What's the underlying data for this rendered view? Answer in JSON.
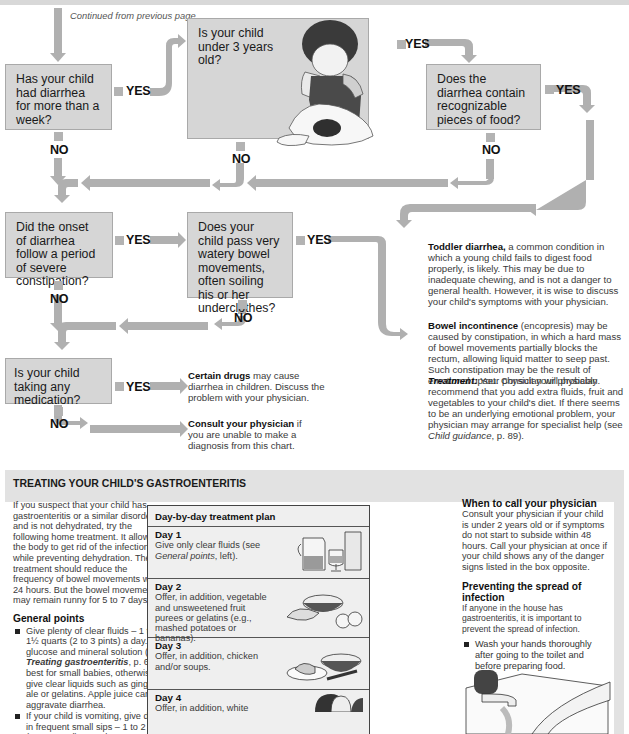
{
  "continued_note": "Continued from previous page",
  "flowchart": {
    "questions": [
      {
        "id": "q1",
        "text": "Has your child had diarrhea for more than a week?"
      },
      {
        "id": "q2",
        "text": "Is your child under 3 years old?"
      },
      {
        "id": "q3",
        "text": "Does the diarrhea contain recognizable pieces of food?"
      },
      {
        "id": "q4",
        "text": "Did the onset of diarrhea follow a period of severe constipation?"
      },
      {
        "id": "q5",
        "text": "Does your child pass very watery bowel movements, often soiling his or her underclothes?"
      },
      {
        "id": "q6",
        "text": "Is your child taking any medication?"
      }
    ],
    "yes_label": "YES",
    "no_label": "NO",
    "results": {
      "toddler": {
        "bold": "Toddler diarrhea,",
        "text": " a common condition in which a young child fails to digest food properly, is likely. This may be due to inadequate chewing, and is not a danger to general health. However, it is wise to discuss your child's symptoms with your physician."
      },
      "bowel": {
        "bold": "Bowel incontinence",
        "text": " (encopresis) may be caused by constipation, in which a hard mass of bowel movements partially blocks the rectum, allowing liquid matter to seep past. Such constipation may be the result of emotional upset. Consult your physician."
      },
      "treatment": {
        "bold": "Treatment:",
        "text": " Your physician will probably recommend that you add extra fluids, fruit and vegetables to your child's diet. If there seems to be an underlying emotional problem, your physician may arrange for specialist help (see ",
        "ref": "Child guidance",
        "tail": ", p. 89)."
      },
      "drugs": {
        "bold": "Certain drugs",
        "text": " may cause diarrhea in children. Discuss the problem with your physician."
      },
      "consult": {
        "bold": "Consult your physician",
        "text": " if you are unable to make a diagnosis from this chart."
      }
    }
  },
  "treatment_section": {
    "title": "TREATING YOUR CHILD'S GASTROENTERITIS",
    "intro": "If you suspect that your child has gastroenteritis or a similar disorder and is not dehydrated, try the following home treatment. It allows the body to get rid of the infection while preventing dehydration. The treatment should reduce the frequency of bowel movements within 24 hours. But the bowel movements may remain runny for 5 to 7 days.",
    "general_points_heading": "General points",
    "general_points": [
      {
        "pre": "Give plenty of clear fluids – 1 to 1½ quarts (2 to 3 pints) a day. A glucose and mineral solution (see ",
        "ref": "Treating gastroenteritis",
        "post": ", p. 63) is best for small babies, otherwise give clear liquids such as ginger ale or gelatins. Apple juice can aggravate diarrhea."
      },
      {
        "pre": "If your child is vomiting, give drinks in frequent small sips – 1 to 2 fl oz (30 to 60 ml) every hour.",
        "ref": "",
        "post": ""
      }
    ],
    "plan": {
      "heading": "Day-by-day treatment plan",
      "days": [
        {
          "label": "Day 1",
          "pre": "Give only clear fluids (see ",
          "ref": "General points",
          "post": ", left)."
        },
        {
          "label": "Day 2",
          "pre": "Offer, in addition, vegetable and unsweetened fruit purees or gelatins (e.g., mashed potatoes or bananas).",
          "ref": "",
          "post": ""
        },
        {
          "label": "Day 3",
          "pre": "Offer, in addition, chicken and/or soups.",
          "ref": "",
          "post": ""
        },
        {
          "label": "Day 4",
          "pre": "Offer, in addition, white",
          "ref": "",
          "post": ""
        }
      ]
    },
    "when_to_call": {
      "heading": "When to call your physician",
      "text": "Consult your physician if your child is under 2 years old or if symptoms do not start to subside within 48 hours. Call your physician at once if your child shows any of the danger signs listed in the box opposite."
    },
    "preventing": {
      "heading": "Preventing the spread of infection",
      "text": "If anyone in the house has gastroenteritis, it is important to prevent the spread of infection.",
      "bullets": [
        "Wash your hands thoroughly after going to the toilet and before preparing food."
      ]
    }
  },
  "colors": {
    "box_fill": "#d6d6d6",
    "arrow": "#b0b0b0",
    "section_band": "#e2e2e2"
  }
}
